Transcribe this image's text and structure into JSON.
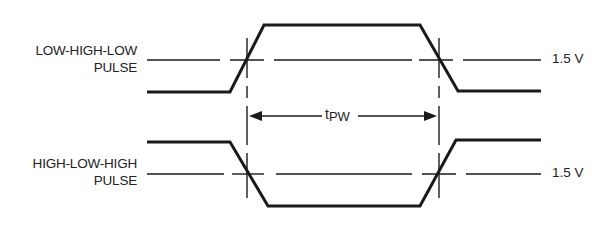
{
  "diagram": {
    "signals": [
      {
        "name": "low-high-low",
        "label_line1": "LOW-HIGH-LOW",
        "label_line2": "PULSE",
        "threshold_label": "1.5 V"
      },
      {
        "name": "high-low-high",
        "label_line1": "HIGH-LOW-HIGH",
        "label_line2": "PULSE",
        "threshold_label": "1.5 V"
      }
    ],
    "measurement": {
      "symbol_main": "t",
      "symbol_sub": "PW",
      "description": "pulse width measured between 1.5 V crossings"
    },
    "colors": {
      "line": "#1a1a1a",
      "background": "#ffffff"
    }
  }
}
